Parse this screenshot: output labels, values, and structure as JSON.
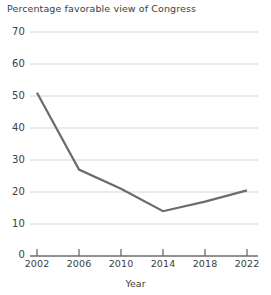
{
  "chart_data": {
    "type": "line",
    "title": "Percentage favorable view of Congress",
    "xlabel": "Year",
    "ylabel": "",
    "x": [
      2002,
      2006,
      2010,
      2014,
      2018,
      2022
    ],
    "values": [
      51,
      27,
      21,
      14,
      17,
      20.5
    ],
    "categories": [
      "2002",
      "2006",
      "2010",
      "2014",
      "2018",
      "2022"
    ],
    "series": [
      {
        "name": "Percentage favorable view of Congress",
        "values": [
          51,
          27,
          21,
          14,
          17,
          20.5
        ]
      }
    ],
    "xlim": [
      2002,
      2022
    ],
    "ylim": [
      0,
      70
    ],
    "yticks": [
      0,
      10,
      20,
      30,
      40,
      50,
      60,
      70
    ],
    "ytick_labels": [
      "0",
      "10",
      "20",
      "30",
      "40",
      "50",
      "60",
      "70"
    ],
    "xticks": [
      2002,
      2006,
      2010,
      2014,
      2018,
      2022
    ],
    "xtick_labels": [
      "2002",
      "2006",
      "2010",
      "2014",
      "2018",
      "2022"
    ],
    "grid": "horizontal",
    "legend": "none",
    "line_color": "#6b6b6b",
    "grid_color": "#d4d4d4",
    "axis_color": "#6b6b6b",
    "background": "#ffffff"
  }
}
